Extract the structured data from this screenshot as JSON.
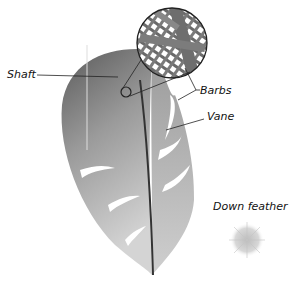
{
  "diagram": {
    "type": "labeled illustration",
    "labels": {
      "shaft": "Shaft",
      "barbs": "Barbs",
      "vane": "Vane",
      "down_feather": "Down feather"
    },
    "parts": [
      "contour feather",
      "magnified barb inset",
      "down feather"
    ],
    "colors": {
      "feather_dark": "#555555",
      "feather_light": "#c8c8c8",
      "line": "#222222"
    }
  }
}
